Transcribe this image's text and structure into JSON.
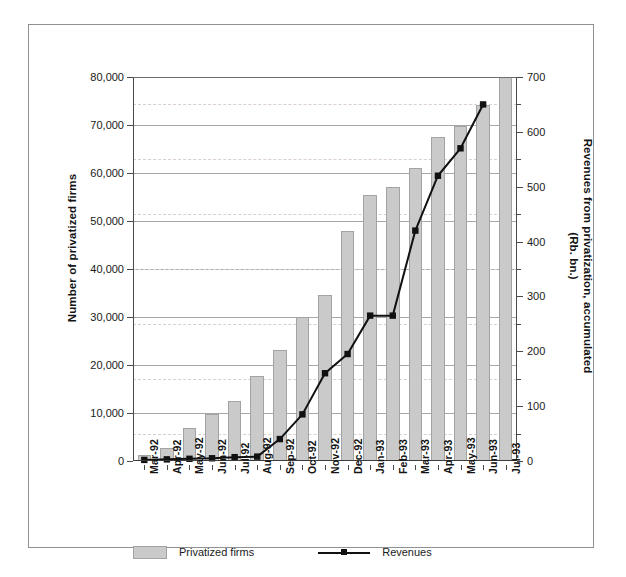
{
  "chart_data": {
    "type": "bar",
    "title": "",
    "subtitle": "",
    "xlabel": "",
    "ylabel": "Number of privatized firms",
    "y2label": "Revenues from privatization, accumulated\n(Rb. bn.)",
    "y_left_label_line1": "Number of privatized firms",
    "y_right_label_line1": "Revenues from privatization, accumulated",
    "y_right_label_line2": "(Rb. bn.)",
    "categories": [
      "Mar-92",
      "Apr-92",
      "May-92",
      "Jun-92",
      "Jul-92",
      "Aug-92",
      "Sep-92",
      "Oct-92",
      "Nov-92",
      "Dec-92",
      "Jan-93",
      "Feb-93",
      "Mar-93",
      "Apr-93",
      "May-93",
      "Jun-93",
      "Jul-93"
    ],
    "ylim": [
      0,
      80000
    ],
    "y2lim": [
      0,
      700
    ],
    "yticks": [
      0,
      10000,
      20000,
      30000,
      40000,
      50000,
      60000,
      70000,
      80000
    ],
    "ytick_labels": [
      "0",
      "10,000",
      "20,000",
      "30,000",
      "40,000",
      "50,000",
      "60,000",
      "70,000",
      "80,000"
    ],
    "y2ticks": [
      0,
      100,
      200,
      300,
      400,
      500,
      600,
      700
    ],
    "y2tick_labels": [
      "0",
      "100",
      "200",
      "300",
      "400",
      "500",
      "600",
      "700"
    ],
    "y2_minor_ticks": [
      50,
      150,
      250,
      350,
      450,
      550,
      650
    ],
    "grid": true,
    "legend_position": "bottom",
    "series": [
      {
        "name": "Privatized firms",
        "type": "bar",
        "axis": "left",
        "color": "#cacaca",
        "values": [
          1300,
          2700,
          6800,
          9700,
          12500,
          17800,
          23100,
          29900,
          34500,
          47900,
          55400,
          57000,
          61100,
          67400,
          69800,
          74100,
          80000
        ]
      },
      {
        "name": "Revenues",
        "type": "line",
        "axis": "right",
        "color": "#111111",
        "values": [
          2,
          3,
          4,
          5,
          7,
          8,
          40,
          85,
          160,
          195,
          265,
          265,
          420,
          520,
          570,
          650,
          null
        ]
      }
    ],
    "legend": [
      {
        "label": "Privatized firms",
        "marker": "filled-rect",
        "color": "#cacaca"
      },
      {
        "label": "Revenues",
        "marker": "line-square",
        "color": "#111111"
      }
    ]
  },
  "caption": {
    "text": ""
  }
}
